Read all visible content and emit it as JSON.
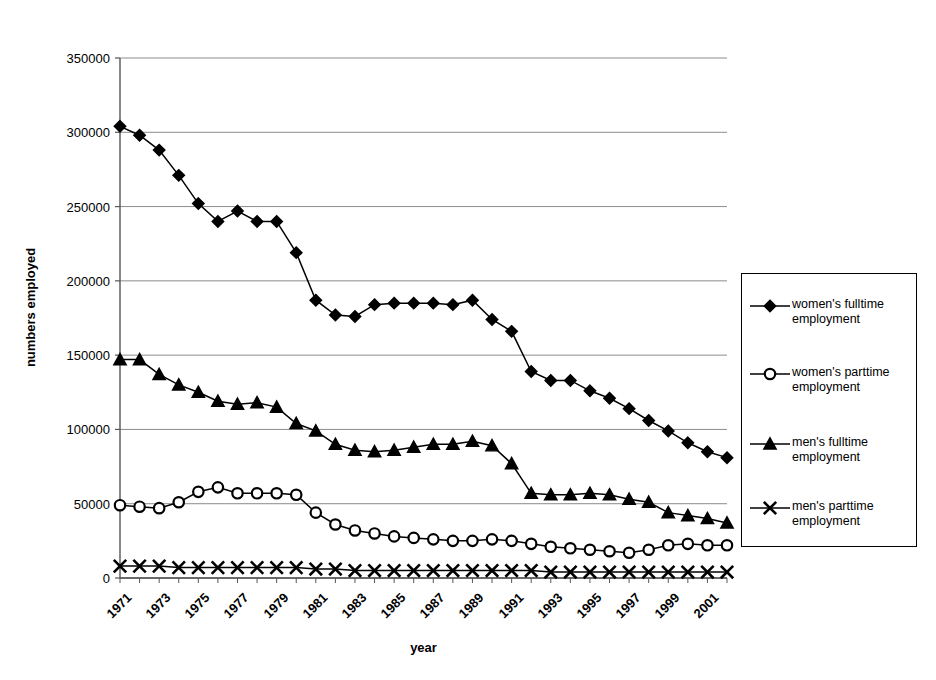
{
  "chart_data": {
    "type": "line",
    "title": "",
    "xlabel": "year",
    "ylabel": "numbers employed",
    "ylim": [
      0,
      350000
    ],
    "ytick_values": [
      0,
      50000,
      100000,
      150000,
      200000,
      250000,
      300000,
      350000
    ],
    "ytick_labels": [
      "0",
      "50000",
      "100000",
      "150000",
      "200000",
      "250000",
      "300000",
      "350000"
    ],
    "grid": true,
    "legend_position": "right",
    "x": [
      1971,
      1972,
      1973,
      1974,
      1975,
      1976,
      1977,
      1978,
      1979,
      1980,
      1981,
      1982,
      1983,
      1984,
      1985,
      1986,
      1987,
      1988,
      1989,
      1990,
      1991,
      1992,
      1993,
      1994,
      1995,
      1996,
      1997,
      1998,
      1999,
      2000,
      2001,
      2002
    ],
    "xtick_labels": [
      "1971",
      "1973",
      "1975",
      "1977",
      "1979",
      "1981",
      "1983",
      "1985",
      "1987",
      "1989",
      "1991",
      "1993",
      "1995",
      "1997",
      "1999",
      "2001"
    ],
    "xtick_years": [
      1971,
      1973,
      1975,
      1977,
      1979,
      1981,
      1983,
      1985,
      1987,
      1989,
      1991,
      1993,
      1995,
      1997,
      1999,
      2001
    ],
    "series": [
      {
        "name": "women's fulltime employment",
        "marker": "diamond",
        "values": [
          304000,
          298000,
          288000,
          271000,
          252000,
          240000,
          247000,
          240000,
          240000,
          219000,
          187000,
          177000,
          176000,
          184000,
          185000,
          185000,
          185000,
          184000,
          187000,
          174000,
          166000,
          139000,
          133000,
          133000,
          126000,
          121000,
          114000,
          106000,
          99000,
          91000,
          85000,
          81000
        ]
      },
      {
        "name": "women's parttime employment",
        "marker": "circle",
        "values": [
          49000,
          48000,
          47000,
          51000,
          58000,
          61000,
          57000,
          57000,
          57000,
          56000,
          44000,
          36000,
          32000,
          30000,
          28000,
          27000,
          26000,
          25000,
          25000,
          26000,
          25000,
          23000,
          21000,
          20000,
          19000,
          18000,
          17000,
          19000,
          22000,
          23000,
          22000,
          22000
        ]
      },
      {
        "name": "men's fulltime employment",
        "marker": "triangle",
        "values": [
          147000,
          147000,
          137000,
          130000,
          125000,
          119000,
          117000,
          118000,
          115000,
          104000,
          99000,
          90000,
          86000,
          85000,
          86000,
          88000,
          90000,
          90000,
          92000,
          89000,
          77000,
          57000,
          56000,
          56000,
          57000,
          56000,
          53000,
          51000,
          44000,
          42000,
          40000,
          37000
        ]
      },
      {
        "name": "men's parttime employment",
        "marker": "cross",
        "values": [
          8000,
          8000,
          8000,
          7000,
          7000,
          7000,
          7000,
          7000,
          7000,
          7000,
          6000,
          6000,
          5000,
          5000,
          5000,
          5000,
          5000,
          5000,
          5000,
          5000,
          5000,
          5000,
          4000,
          4000,
          4000,
          4000,
          4000,
          4000,
          4000,
          4000,
          4000,
          4000
        ]
      }
    ]
  },
  "legend": {
    "items": [
      {
        "label_line1": "women's fulltime",
        "label_line2": "employment",
        "marker": "diamond"
      },
      {
        "label_line1": "women's parttime",
        "label_line2": "employment",
        "marker": "circle"
      },
      {
        "label_line1": "men's fulltime",
        "label_line2": "employment",
        "marker": "triangle"
      },
      {
        "label_line1": "men's parttime",
        "label_line2": "employment",
        "marker": "cross"
      }
    ]
  },
  "style": {
    "line_color": "#000000",
    "grid_color": "#8c8c8c",
    "axis_color": "#555555",
    "background": "#ffffff"
  }
}
